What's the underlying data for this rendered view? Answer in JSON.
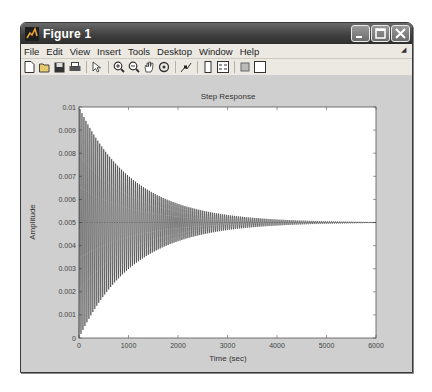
{
  "window": {
    "title": "Figure 1",
    "buttons": {
      "minimize": "minimize",
      "maximize": "maximize",
      "close": "close"
    }
  },
  "menubar": {
    "items": [
      "File",
      "Edit",
      "View",
      "Insert",
      "Tools",
      "Desktop",
      "Window",
      "Help"
    ]
  },
  "toolbar": {
    "icons": [
      "new-figure-icon",
      "open-file-icon",
      "save-icon",
      "print-icon",
      "select-arrow-icon",
      "zoom-in-icon",
      "zoom-out-icon",
      "pan-icon",
      "rotate-3d-icon",
      "data-cursor-icon",
      "colorbar-icon",
      "legend-icon",
      "hide-plot-tools-icon",
      "show-plot-tools-icon"
    ]
  },
  "plot": {
    "title": "Step Response",
    "xlabel": "Time (sec)",
    "ylabel": "Amplitude",
    "xticks": [
      "0",
      "1000",
      "2000",
      "3000",
      "4000",
      "5000",
      "6000"
    ],
    "yticks": [
      "0",
      "0.001",
      "0.002",
      "0.003",
      "0.004",
      "0.005",
      "0.006",
      "0.007",
      "0.008",
      "0.009",
      "0.01"
    ]
  },
  "chart_data": {
    "type": "line",
    "title": "Step Response",
    "xlabel": "Time (sec)",
    "ylabel": "Amplitude",
    "xlim": [
      0,
      6000
    ],
    "ylim": [
      0,
      0.01
    ],
    "grid": false,
    "legend": "none",
    "note": "Axis ranges, ticks and labels are read from the figure. The envelope points below are rough visual estimates from gridline positions, not values labeled in the image. The oscillation period and decay constant are NOT visible in the screenshot; generator_params are chosen only to reproduce the apparent shape.",
    "steady_state_estimate": 0.005,
    "envelope_estimate": {
      "x": [
        0,
        500,
        1000,
        1500,
        2000,
        3000,
        4000,
        5000,
        6000
      ],
      "upper": [
        0.0098,
        0.0082,
        0.0071,
        0.0064,
        0.0059,
        0.0054,
        0.0052,
        0.0051,
        0.005
      ],
      "lower": [
        0.0002,
        0.0018,
        0.0029,
        0.0036,
        0.0041,
        0.0046,
        0.0048,
        0.0049,
        0.005
      ]
    },
    "generator_params": {
      "assumed": true,
      "form": "y = A - A*exp(-t/tau)*cos(2*pi*t/period)",
      "A": 0.005,
      "tau": 1100,
      "period": 40
    }
  }
}
